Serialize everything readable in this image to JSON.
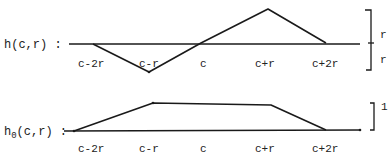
{
  "diagram": {
    "functions": [
      {
        "id": "h",
        "label": "h(c,r) :",
        "label_main": "h",
        "label_sub": "",
        "label_args": "(c,r) :",
        "ticks": [
          "c-2r",
          "c-r",
          "c",
          "c+r",
          "c+2r"
        ],
        "shape": "negative triangle on [c-2r, c] then positive triangle on [c, c+2r]",
        "scale_labels": [
          "r",
          "r"
        ]
      },
      {
        "id": "h0",
        "label": "h0(c,r) :",
        "label_main": "h",
        "label_sub": "0",
        "label_args": "(c,r) :",
        "ticks": [
          "c-2r",
          "c-r",
          "c",
          "c+r",
          "c+2r"
        ],
        "shape": "trapezoid: ramp up on [c-2r, c-r], flat at 1 on [c-r, c+r], ramp down on [c+r, c+2r]",
        "scale_labels": [
          "1"
        ]
      }
    ]
  }
}
